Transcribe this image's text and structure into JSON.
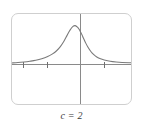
{
  "figure": {
    "caption": "c = 2",
    "caption_parts": {
      "variable": "c",
      "relation": "=",
      "value": "2"
    },
    "frame": {
      "border_color": "#cfcfcf",
      "background": "#ffffff",
      "corner_radius": 7,
      "x": 11,
      "y": 13,
      "width": 121,
      "height": 92
    }
  },
  "chart_data": {
    "type": "line",
    "title": "",
    "subtitle": "",
    "xlabel": "",
    "ylabel": "",
    "grid": false,
    "legend": null,
    "axis_color": "#8a8a8a",
    "curve_color": "#7a7a7a",
    "xlim": [
      -4.6,
      3.4
    ],
    "ylim": [
      -1.05,
      1.35
    ],
    "x_axis_y": 0,
    "y_axis_x": 0,
    "x_ticks": [
      -3.8,
      -2.2,
      1.6
    ],
    "y_ticks": [],
    "annotations": [],
    "series": [
      {
        "name": "curve",
        "note": "peaked bell-shaped curve with long tails, apex left of the y-axis",
        "x": [
          -4.6,
          -4.2,
          -3.8,
          -3.4,
          -3.0,
          -2.6,
          -2.2,
          -1.9,
          -1.6,
          -1.35,
          -1.1,
          -0.9,
          -0.7,
          -0.5,
          -0.35,
          -0.2,
          -0.1,
          0.0,
          0.1,
          0.2,
          0.35,
          0.5,
          0.7,
          0.9,
          1.1,
          1.35,
          1.6,
          2.0,
          2.4,
          2.8,
          3.4
        ],
        "y": [
          0.045,
          0.055,
          0.07,
          0.09,
          0.115,
          0.155,
          0.215,
          0.28,
          0.37,
          0.48,
          0.63,
          0.78,
          0.92,
          1.02,
          1.04,
          1.0,
          0.95,
          0.88,
          0.8,
          0.71,
          0.58,
          0.47,
          0.35,
          0.265,
          0.205,
          0.155,
          0.125,
          0.09,
          0.07,
          0.058,
          0.05
        ]
      }
    ]
  }
}
